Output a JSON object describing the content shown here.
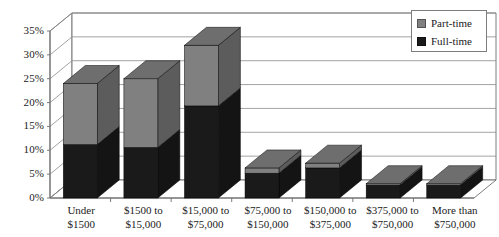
{
  "chart_data": {
    "type": "bar",
    "subtype": "stacked-column-3d",
    "title": "",
    "subtitle": "",
    "xlabel": "",
    "ylabel": "",
    "ylim": [
      0,
      35
    ],
    "ytick_labels": [
      "0%",
      "5%",
      "10%",
      "15%",
      "20%",
      "25%",
      "30%",
      "35%"
    ],
    "ytick_values": [
      0,
      5,
      10,
      15,
      20,
      25,
      30,
      35
    ],
    "grid": true,
    "legend_position": "top-right",
    "categories": [
      "Under\n$1500",
      "$1500 to\n$15,000",
      "$15,000 to\n$75,000",
      "$75,000 to\n$150,000",
      "$150,000 to\n$375,000",
      "$375,000 to\n$750,000",
      "More than\n$750,000"
    ],
    "category_lines": [
      [
        "Under",
        "$1500"
      ],
      [
        "$1500 to",
        "$15,000"
      ],
      [
        "$15,000 to",
        "$75,000"
      ],
      [
        "$75,000 to",
        "$150,000"
      ],
      [
        "$150,000 to",
        "$375,000"
      ],
      [
        "$375,000 to",
        "$750,000"
      ],
      [
        "More than",
        "$750,000"
      ]
    ],
    "series": [
      {
        "name": "Full-time",
        "color": "#1a1a1a",
        "values": [
          11.2,
          10.6,
          19.3,
          5.2,
          6.3,
          2.7,
          2.7
        ]
      },
      {
        "name": "Part-time",
        "color": "#808080",
        "values": [
          12.8,
          14.4,
          12.7,
          1.1,
          1.0,
          0.3,
          0.3
        ]
      }
    ],
    "totals": [
      24.0,
      25.0,
      32.0,
      6.3,
      7.3,
      3.0,
      3.0
    ]
  },
  "legend": {
    "items": [
      {
        "label": "Part-time",
        "color": "#808080",
        "swatch": "part"
      },
      {
        "label": "Full-time",
        "color": "#1a1a1a",
        "swatch": "full"
      }
    ]
  },
  "colors": {
    "part_time": "#808080",
    "full_time": "#1a1a1a",
    "grid": "#8c8c8c",
    "axis": "#6e6e6e",
    "background": "#ffffff"
  }
}
